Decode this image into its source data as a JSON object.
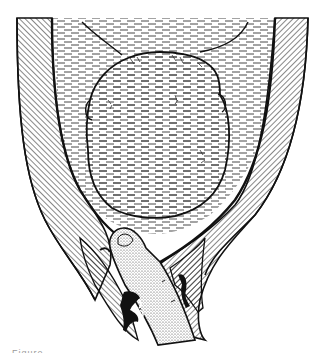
{
  "figure": {
    "regions": [
      "uterine-wall-left",
      "uterine-wall-right",
      "amniotic-fluid",
      "fetal-head",
      "examining-finger",
      "cervix",
      "vaginal-wall"
    ],
    "colors": {
      "ink": "#111111",
      "paper": "#ffffff",
      "stipple": "#b8b8b8"
    }
  },
  "caption": {
    "text": "Figure"
  }
}
